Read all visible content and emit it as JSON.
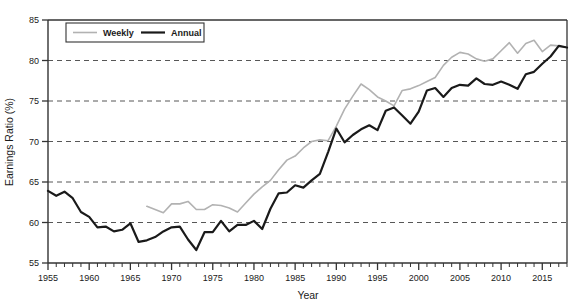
{
  "chart_data": {
    "type": "line",
    "title": "",
    "xlabel": "Year",
    "ylabel": "Earnings Ratio (%)",
    "xlim": [
      1955,
      2018
    ],
    "ylim": [
      55,
      85
    ],
    "yticks": [
      55,
      60,
      65,
      70,
      75,
      80,
      85
    ],
    "xticks": [
      1955,
      1960,
      1965,
      1970,
      1975,
      1980,
      1985,
      1990,
      1995,
      2000,
      2005,
      2010,
      2015
    ],
    "xtick_minor_step": 1,
    "grid": "horizontal-dashed",
    "legend_position": "top-left-inside",
    "series": [
      {
        "name": "Weekly",
        "color": "#b2b2b2",
        "width": 1.6,
        "x": [
          1967,
          1968,
          1969,
          1970,
          1971,
          1972,
          1973,
          1974,
          1975,
          1976,
          1977,
          1978,
          1979,
          1980,
          1981,
          1982,
          1983,
          1984,
          1985,
          1986,
          1987,
          1988,
          1989,
          1990,
          1991,
          1992,
          1993,
          1994,
          1995,
          1996,
          1997,
          1998,
          1999,
          2000,
          2001,
          2002,
          2003,
          2004,
          2005,
          2006,
          2007,
          2008,
          2009,
          2010,
          2011,
          2012,
          2013,
          2014,
          2015,
          2016,
          2017,
          2018
        ],
        "values": [
          62.0,
          61.6,
          61.2,
          62.3,
          62.3,
          62.6,
          61.6,
          61.6,
          62.2,
          62.1,
          61.8,
          61.3,
          62.4,
          63.5,
          64.4,
          65.2,
          66.5,
          67.7,
          68.2,
          69.2,
          70.0,
          70.2,
          70.1,
          71.9,
          74.0,
          75.6,
          77.1,
          76.4,
          75.5,
          75.0,
          74.4,
          76.3,
          76.5,
          76.9,
          77.4,
          77.9,
          79.4,
          80.4,
          81.0,
          80.8,
          80.2,
          79.9,
          80.2,
          81.2,
          82.2,
          80.9,
          82.1,
          82.5,
          81.1,
          81.9,
          81.8,
          81.6
        ]
      },
      {
        "name": "Annual",
        "color": "#1a1a1a",
        "width": 2.2,
        "x": [
          1955,
          1956,
          1957,
          1958,
          1959,
          1960,
          1961,
          1962,
          1963,
          1964,
          1965,
          1966,
          1967,
          1968,
          1969,
          1970,
          1971,
          1972,
          1973,
          1974,
          1975,
          1976,
          1977,
          1978,
          1979,
          1980,
          1981,
          1982,
          1983,
          1984,
          1985,
          1986,
          1987,
          1988,
          1989,
          1990,
          1991,
          1992,
          1993,
          1994,
          1995,
          1996,
          1997,
          1998,
          1999,
          2000,
          2001,
          2002,
          2003,
          2004,
          2005,
          2006,
          2007,
          2008,
          2009,
          2010,
          2011,
          2012,
          2013,
          2014,
          2015,
          2016,
          2017,
          2018
        ],
        "values": [
          63.9,
          63.3,
          63.8,
          63.0,
          61.3,
          60.7,
          59.4,
          59.5,
          58.9,
          59.1,
          59.9,
          57.6,
          57.8,
          58.2,
          58.9,
          59.4,
          59.5,
          57.9,
          56.6,
          58.8,
          58.8,
          60.2,
          58.9,
          59.7,
          59.7,
          60.2,
          59.2,
          61.7,
          63.6,
          63.7,
          64.6,
          64.3,
          65.2,
          66.0,
          68.7,
          71.6,
          69.9,
          70.8,
          71.5,
          72.0,
          71.4,
          73.8,
          74.2,
          73.2,
          72.2,
          73.7,
          76.3,
          76.6,
          75.5,
          76.6,
          77.0,
          76.9,
          77.8,
          77.1,
          77.0,
          77.4,
          77.0,
          76.5,
          78.3,
          78.6,
          79.6,
          80.5,
          81.8,
          81.6
        ]
      }
    ]
  },
  "legend": {
    "items": [
      {
        "label": "Weekly",
        "color": "#b2b2b2"
      },
      {
        "label": "Annual",
        "color": "#1a1a1a"
      }
    ]
  }
}
